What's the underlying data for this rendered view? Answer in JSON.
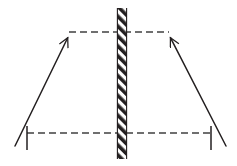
{
  "figure": {
    "type": "line-diagram",
    "title": "",
    "width": 237,
    "height": 166,
    "background_color": "#ffffff",
    "stroke_color": "#231f20",
    "hatch_color": "#231f20",
    "labels": []
  },
  "chart_data": {
    "type": "scatter",
    "title": "",
    "xlabel": "",
    "ylabel": "",
    "grid": false,
    "legend": null,
    "xlim": [
      0,
      237
    ],
    "ylim": [
      166,
      0
    ],
    "elements": [
      {
        "name": "hatched-barrier",
        "kind": "hatched-rect",
        "x": 117,
        "y": 8,
        "width": 10,
        "height": 151,
        "hatch_angle_deg": 45,
        "hatch_spacing": 7
      },
      {
        "name": "top-dashed-line",
        "kind": "dashed-line",
        "x1": 69,
        "y1": 32,
        "x2": 169,
        "y2": 32,
        "dash": "7,4"
      },
      {
        "name": "bottom-dashed-line",
        "kind": "dashed-line",
        "x1": 27,
        "y1": 133,
        "x2": 212,
        "y2": 133,
        "dash": "7,4"
      },
      {
        "name": "left-ray",
        "kind": "arrow-line",
        "x1": 15,
        "y1": 146,
        "x2": 71,
        "y2": 31,
        "arrow_at": "end"
      },
      {
        "name": "right-ray",
        "kind": "arrow-line",
        "x1": 226,
        "y1": 146,
        "x2": 167,
        "y2": 31,
        "arrow_at": "end"
      },
      {
        "name": "left-base-tick",
        "kind": "line",
        "x1": 27,
        "y1": 126,
        "x2": 27,
        "y2": 150
      },
      {
        "name": "right-base-tick",
        "kind": "line",
        "x1": 211,
        "y1": 126,
        "x2": 211,
        "y2": 150
      }
    ]
  }
}
